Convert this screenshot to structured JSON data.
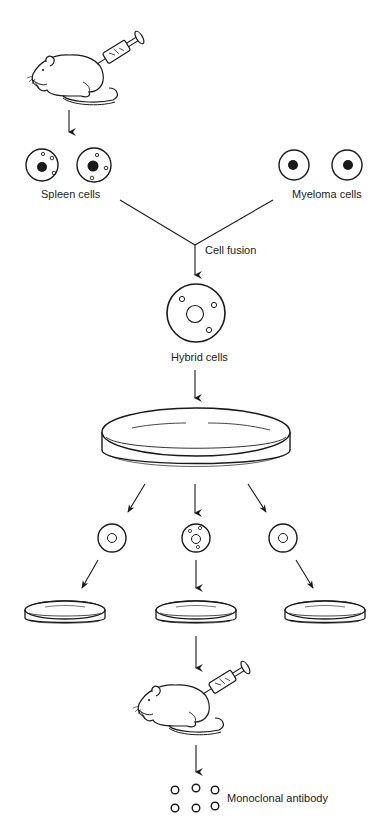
{
  "diagram": {
    "labels": {
      "spleen_cells": "Spleen cells",
      "myeloma_cells": "Myeloma cells",
      "cell_fusion": "Cell fusion",
      "hybrid_cells": "Hybrid cells",
      "monoclonal_antibody": "Monoclonal antibody"
    },
    "icons": {
      "mouse_top": "mouse-with-syringe-icon",
      "spleen_cell": "spleen-cell-icon",
      "myeloma_cell": "myeloma-cell-icon",
      "hybrid_cell": "hybrid-cell-icon",
      "large_dish": "petri-dish-icon",
      "clone_cell": "clone-cell-icon",
      "small_dish": "petri-dish-icon",
      "mouse_bottom": "mouse-with-syringe-icon",
      "antibody": "antibody-circle-icon"
    },
    "colors": {
      "stroke": "#1a1a1a",
      "background": "#ffffff"
    }
  }
}
